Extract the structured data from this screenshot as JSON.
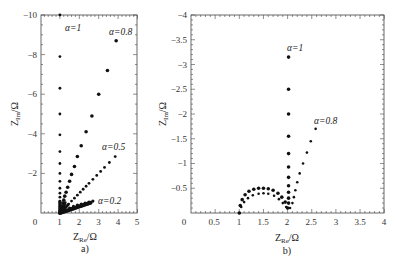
{
  "chart_data": [
    {
      "panel": "a)",
      "type": "scatter",
      "xlabel": "Z_Re/Ω",
      "ylabel": "Z_Im/Ω",
      "xlim": [
        0,
        5
      ],
      "ylim": [
        0,
        -10
      ],
      "xticks": [
        "0",
        "1",
        "2",
        "3",
        "4",
        "5"
      ],
      "yticks": [
        "-2",
        "-4",
        "-6",
        "-8",
        "-10"
      ],
      "grid": false,
      "series": [
        {
          "name": "α=1",
          "label_pos": [
            1.5,
            -9.3
          ],
          "points": [
            [
              1,
              -10
            ],
            [
              1,
              -7.9
            ],
            [
              1,
              -6.3
            ],
            [
              1,
              -5.0
            ],
            [
              1,
              -3.95
            ],
            [
              1,
              -3.1
            ],
            [
              1,
              -2.5
            ],
            [
              1,
              -2.0
            ],
            [
              1,
              -1.6
            ],
            [
              1,
              -1.25
            ],
            [
              1,
              -1.0
            ],
            [
              1,
              -0.8
            ],
            [
              1,
              -0.6
            ],
            [
              1,
              -0.45
            ],
            [
              1,
              -0.33
            ],
            [
              1,
              -0.22
            ],
            [
              1,
              -0.12
            ],
            [
              1,
              -0.05
            ]
          ]
        },
        {
          "name": "α=0.8",
          "label_pos": [
            3.6,
            -9.2
          ],
          "points": [
            [
              3.9,
              -8.7
            ],
            [
              3.45,
              -7.2
            ],
            [
              3.0,
              -6.0
            ],
            [
              2.65,
              -4.9
            ],
            [
              2.35,
              -4.1
            ],
            [
              2.1,
              -3.4
            ],
            [
              1.9,
              -2.85
            ],
            [
              1.75,
              -2.35
            ],
            [
              1.6,
              -1.95
            ],
            [
              1.5,
              -1.6
            ],
            [
              1.4,
              -1.3
            ],
            [
              1.32,
              -1.05
            ],
            [
              1.25,
              -0.85
            ],
            [
              1.2,
              -0.65
            ],
            [
              1.15,
              -0.5
            ],
            [
              1.1,
              -0.35
            ],
            [
              1.06,
              -0.22
            ],
            [
              1.03,
              -0.1
            ]
          ]
        },
        {
          "name": "α=0.5",
          "label_pos": [
            3.5,
            -3.3
          ],
          "points": [
            [
              3.85,
              -2.85
            ],
            [
              3.55,
              -2.55
            ],
            [
              3.3,
              -2.3
            ],
            [
              3.1,
              -2.1
            ],
            [
              2.9,
              -1.9
            ],
            [
              2.7,
              -1.7
            ],
            [
              2.5,
              -1.5
            ],
            [
              2.35,
              -1.35
            ],
            [
              2.2,
              -1.2
            ],
            [
              2.05,
              -1.05
            ],
            [
              1.9,
              -0.9
            ],
            [
              1.75,
              -0.75
            ],
            [
              1.6,
              -0.6
            ],
            [
              1.45,
              -0.45
            ],
            [
              1.3,
              -0.3
            ],
            [
              1.15,
              -0.15
            ]
          ]
        },
        {
          "name": "α=0.2",
          "label_pos": [
            3.3,
            -0.6
          ],
          "points": [
            [
              2.7,
              -0.6
            ],
            [
              2.5,
              -0.55
            ],
            [
              2.3,
              -0.5
            ],
            [
              2.1,
              -0.45
            ],
            [
              1.9,
              -0.4
            ],
            [
              1.7,
              -0.33
            ],
            [
              1.5,
              -0.25
            ],
            [
              1.3,
              -0.15
            ],
            [
              1.15,
              -0.08
            ]
          ]
        }
      ]
    },
    {
      "panel": "b)",
      "type": "scatter",
      "xlabel": "Z_Re/Ω",
      "ylabel": "Z_Im/Ω",
      "xlim": [
        0,
        4
      ],
      "ylim": [
        0,
        -4
      ],
      "xticks": [
        "0",
        "0.5",
        "1",
        "1.5",
        "2",
        "2.5",
        "3",
        "3.5",
        "4"
      ],
      "yticks": [
        "-0.5",
        "-1",
        "-1.5",
        "-2",
        "-2.5",
        "-3",
        "-3.5",
        "-4"
      ],
      "grid": false,
      "series": [
        {
          "name": "α=1",
          "label_pos": [
            2.0,
            -3.35
          ],
          "points": [
            [
              1.0,
              0
            ],
            [
              1.02,
              -0.15
            ],
            [
              1.06,
              -0.27
            ],
            [
              1.12,
              -0.37
            ],
            [
              1.2,
              -0.44
            ],
            [
              1.3,
              -0.48
            ],
            [
              1.4,
              -0.5
            ],
            [
              1.5,
              -0.5
            ],
            [
              1.6,
              -0.49
            ],
            [
              1.7,
              -0.46
            ],
            [
              1.8,
              -0.4
            ],
            [
              1.88,
              -0.32
            ],
            [
              1.95,
              -0.22
            ],
            [
              2.0,
              -0.1
            ],
            [
              2.02,
              -0.2
            ],
            [
              2.02,
              -0.3
            ],
            [
              2.02,
              -0.42
            ],
            [
              2.02,
              -0.55
            ],
            [
              2.02,
              -0.72
            ],
            [
              2.02,
              -0.93
            ],
            [
              2.02,
              -1.2
            ],
            [
              2.02,
              -1.55
            ],
            [
              2.02,
              -2.0
            ],
            [
              2.02,
              -2.5
            ],
            [
              2.02,
              -3.15
            ]
          ]
        },
        {
          "name": "α=0.8",
          "label_pos": [
            2.55,
            -1.8
          ],
          "points": [
            [
              1.0,
              0
            ],
            [
              1.04,
              -0.12
            ],
            [
              1.1,
              -0.22
            ],
            [
              1.18,
              -0.3
            ],
            [
              1.28,
              -0.36
            ],
            [
              1.4,
              -0.39
            ],
            [
              1.5,
              -0.4
            ],
            [
              1.6,
              -0.39
            ],
            [
              1.72,
              -0.35
            ],
            [
              1.82,
              -0.28
            ],
            [
              1.9,
              -0.2
            ],
            [
              1.97,
              -0.12
            ],
            [
              2.05,
              -0.1
            ],
            [
              2.1,
              -0.2
            ],
            [
              2.13,
              -0.32
            ],
            [
              2.16,
              -0.46
            ],
            [
              2.2,
              -0.62
            ],
            [
              2.25,
              -0.8
            ],
            [
              2.32,
              -1.0
            ],
            [
              2.4,
              -1.22
            ],
            [
              2.48,
              -1.45
            ],
            [
              2.58,
              -1.7
            ]
          ]
        }
      ]
    }
  ],
  "panels": {
    "a": {
      "label": "a)",
      "xlabel_main": "Z",
      "xlabel_sub": "Re",
      "xlabel_unit": "/Ω",
      "ylabel_main": "Z",
      "ylabel_sub": "Im",
      "ylabel_unit": "/Ω",
      "xtick_labels": [
        "0",
        "1",
        "2",
        "3",
        "4",
        "5"
      ],
      "ytick_labels": [
        "−2",
        "−4",
        "−6",
        "−8",
        "−10"
      ],
      "annotations": [
        "α=1",
        "α=0.8",
        "α=0.5",
        "α=0.2"
      ]
    },
    "b": {
      "label": "b)",
      "xlabel_main": "Z",
      "xlabel_sub": "Re",
      "xlabel_unit": "/Ω",
      "ylabel_main": "Z",
      "ylabel_sub": "Im",
      "ylabel_unit": "/Ω",
      "xtick_labels": [
        "0",
        "0.5",
        "1",
        "1.5",
        "2",
        "2.5",
        "3",
        "3.5",
        "4"
      ],
      "ytick_labels": [
        "−0.5",
        "−1",
        "−1.5",
        "−2",
        "−2.5",
        "−3",
        "−3.5",
        "−4"
      ],
      "annotations": [
        "α=1",
        "α=0.8"
      ]
    }
  }
}
